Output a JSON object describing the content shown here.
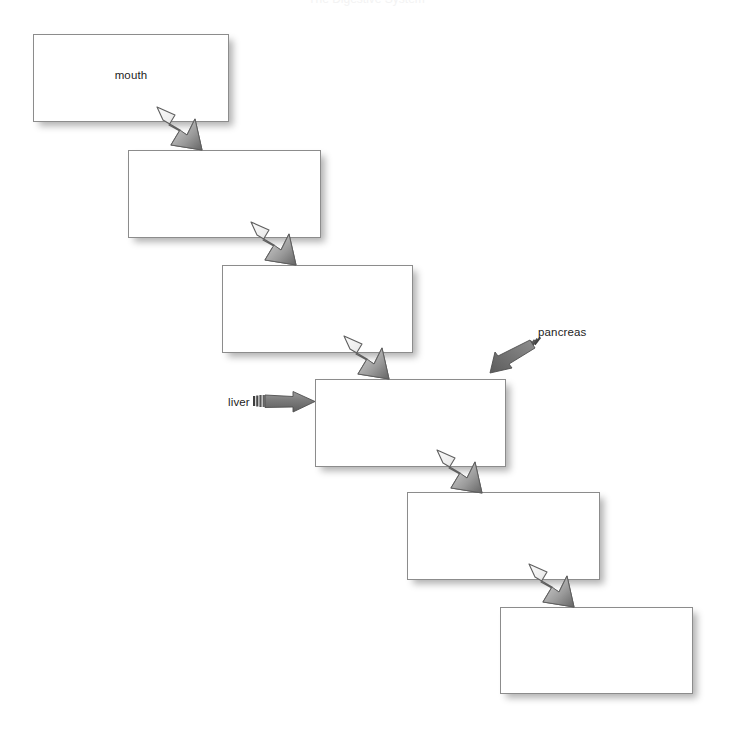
{
  "page": {
    "title_remnant": "The Digestive System",
    "background_color": "#ffffff",
    "width": 733,
    "height": 738
  },
  "diagram": {
    "type": "flow-staircase",
    "box_style": {
      "fill": "#ffffff",
      "border_color": "#8c8c8c",
      "shadow_color": "rgba(0,0,0,0.30)"
    },
    "arrow_style": {
      "flow_light": "#f2f2f2",
      "flow_dark": "#6e6e6e",
      "flow_outline": "#5a5a5a",
      "callout_fill": "#707070",
      "callout_outline": "#5a5a5a"
    },
    "boxes": [
      {
        "id": "box-1",
        "label": "mouth",
        "x": 33,
        "y": 34,
        "w": 196,
        "h": 88
      },
      {
        "id": "box-2",
        "label": "",
        "x": 128,
        "y": 150,
        "w": 193,
        "h": 88
      },
      {
        "id": "box-3",
        "label": "",
        "x": 222,
        "y": 265,
        "w": 191,
        "h": 88
      },
      {
        "id": "box-4",
        "label": "",
        "x": 315,
        "y": 379,
        "w": 191,
        "h": 88
      },
      {
        "id": "box-5",
        "label": "",
        "x": 407,
        "y": 492,
        "w": 193,
        "h": 88
      },
      {
        "id": "box-6",
        "label": "",
        "x": 500,
        "y": 607,
        "w": 193,
        "h": 87
      }
    ],
    "flow_arrows": [
      {
        "id": "flow-1-2",
        "from": "box-1",
        "to": "box-2",
        "direction": "down-right"
      },
      {
        "id": "flow-2-3",
        "from": "box-2",
        "to": "box-3",
        "direction": "down-right"
      },
      {
        "id": "flow-3-4",
        "from": "box-3",
        "to": "box-4",
        "direction": "down-right"
      },
      {
        "id": "flow-4-5",
        "from": "box-4",
        "to": "box-5",
        "direction": "down-right"
      },
      {
        "id": "flow-5-6",
        "from": "box-5",
        "to": "box-6",
        "direction": "down-right"
      }
    ],
    "callouts": [
      {
        "id": "callout-liver",
        "label": "liver",
        "target": "box-4",
        "direction": "right",
        "label_x": 228,
        "label_y": 396,
        "arrow_x": 255,
        "arrow_y": 390
      },
      {
        "id": "callout-pancreas",
        "label": "pancreas",
        "target": "box-4",
        "direction": "down-left",
        "label_x": 538,
        "label_y": 326,
        "arrow_x": 487,
        "arrow_y": 338
      }
    ]
  }
}
